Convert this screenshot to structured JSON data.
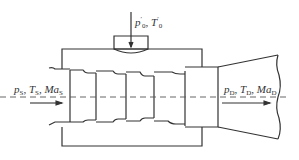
{
  "diagram": {
    "type": "ejector / multi-stage nozzle schematic",
    "stroke_color": "#333333",
    "centerline_style": "dashed",
    "labels": {
      "top_inlet": {
        "p": "p",
        "p_sup": "′",
        "p_sub": "0",
        "sep": ", ",
        "T": "T",
        "T_sup": "′",
        "T_sub": "0"
      },
      "suction_inlet": {
        "p": "p",
        "p_sub": "S",
        "sep1": ", ",
        "T": "T",
        "T_sub": "S",
        "sep2": ", ",
        "Ma": "Ma",
        "Ma_sub": "S"
      },
      "discharge_outlet": {
        "p": "p",
        "p_sub": "D",
        "sep1": ", ",
        "T": "T",
        "T_sub": "D",
        "sep2": ", ",
        "Ma": "Ma",
        "Ma_sub": "D"
      }
    },
    "components": [
      "top-inlet-cap",
      "outer-casing",
      "stage-1",
      "stage-2",
      "stage-3",
      "stage-4",
      "mixing-section",
      "diffuser",
      "flow-arrows",
      "centerline"
    ]
  }
}
